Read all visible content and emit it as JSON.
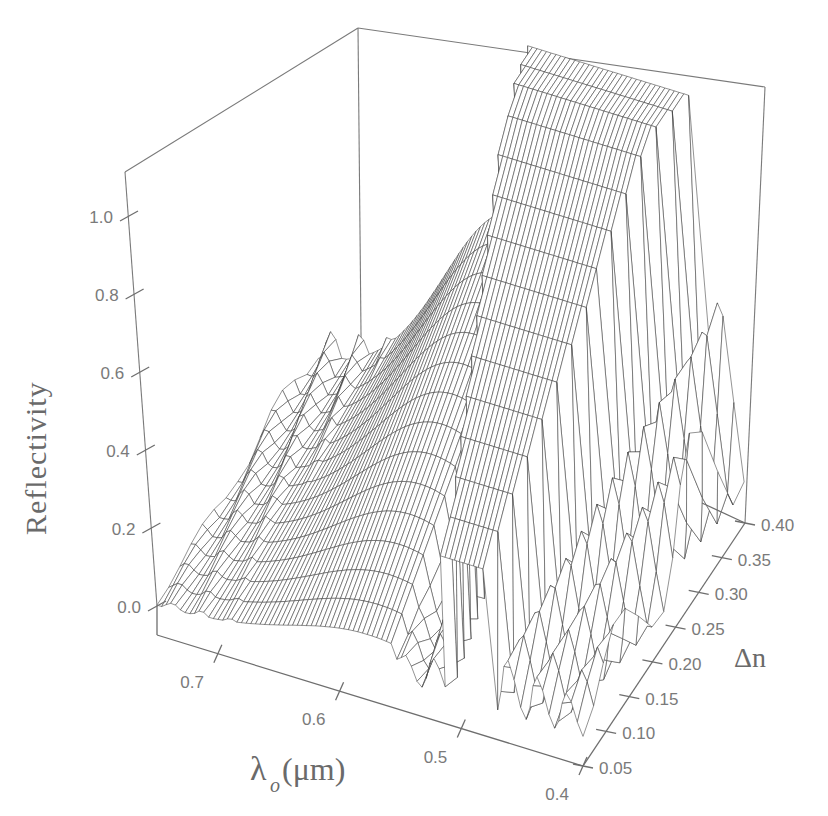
{
  "chart_data": {
    "type": "surface3d",
    "title": "",
    "xlabel": "λo(μm)",
    "xlabel_main": "λ",
    "xlabel_sub": "o",
    "xlabel_unit": "(μm)",
    "ylabel": "Δn",
    "zlabel": "Reflectivity",
    "x_axis": {
      "name": "λo (μm)",
      "range": [
        0.75,
        0.4
      ],
      "ticks": [
        "0.7",
        "0.6",
        "0.5",
        "0.4"
      ]
    },
    "y_axis": {
      "name": "Δn",
      "range": [
        0.05,
        0.4
      ],
      "ticks": [
        "0.05",
        "0.10",
        "0.15",
        "0.20",
        "0.25",
        "0.30",
        "0.35",
        "0.40"
      ]
    },
    "z_axis": {
      "name": "Reflectivity",
      "range": [
        0.0,
        1.1
      ],
      "ticks": [
        "0.0",
        "0.2",
        "0.4",
        "0.6",
        "0.8",
        "1.0"
      ]
    },
    "grid": false,
    "legend": null,
    "surface_description": "Wireframe reflectivity surface R(λo, Δn): long-wavelength side rises smoothly to ~0.55 at Δn=0.40 near λo≈0.57; deep minimum (R≈0) near λo≈0.55; stop-band plateau at R≈1.0 for λo≈0.53–0.45 widening with Δn; oscillating side lobes (0.3–0.5) toward λo=0.4.",
    "sample_points": [
      {
        "lambda": 0.75,
        "dn": 0.05,
        "R": 0.0
      },
      {
        "lambda": 0.75,
        "dn": 0.4,
        "R": 0.02
      },
      {
        "lambda": 0.57,
        "dn": 0.4,
        "R": 0.55
      },
      {
        "lambda": 0.55,
        "dn": 0.4,
        "R": 0.02
      },
      {
        "lambda": 0.52,
        "dn": 0.4,
        "R": 1.0
      },
      {
        "lambda": 0.45,
        "dn": 0.4,
        "R": 1.0
      },
      {
        "lambda": 0.42,
        "dn": 0.4,
        "R": 0.45
      },
      {
        "lambda": 0.5,
        "dn": 0.05,
        "R": 0.1
      },
      {
        "lambda": 0.4,
        "dn": 0.05,
        "R": 0.0
      }
    ]
  }
}
